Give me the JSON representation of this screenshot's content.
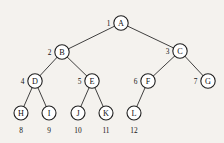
{
  "figure": {
    "type": "binary-tree-diagram",
    "background_color": "#f4f2ee",
    "stroke_color": "#1f1f1f",
    "text_color": "#111111",
    "node_radius": 7.2,
    "leaf_radius": 7.0
  },
  "nodes": [
    {
      "id": "A",
      "label": "A",
      "index": "1",
      "index_position": "left",
      "x": 121,
      "y": 23,
      "level": 0
    },
    {
      "id": "B",
      "label": "B",
      "index": "2",
      "index_position": "left",
      "x": 62,
      "y": 52,
      "level": 1
    },
    {
      "id": "C",
      "label": "C",
      "index": "3",
      "index_position": "left",
      "x": 180,
      "y": 51,
      "level": 1
    },
    {
      "id": "D",
      "label": "D",
      "index": "4",
      "index_position": "left",
      "x": 35,
      "y": 81,
      "level": 2
    },
    {
      "id": "E",
      "label": "E",
      "index": "5",
      "index_position": "left",
      "x": 92,
      "y": 81,
      "level": 2
    },
    {
      "id": "F",
      "label": "F",
      "index": "6",
      "index_position": "left",
      "x": 148,
      "y": 81,
      "level": 2
    },
    {
      "id": "G",
      "label": "G",
      "index": "7",
      "index_position": "left",
      "x": 208,
      "y": 81,
      "level": 2
    },
    {
      "id": "H",
      "label": "H",
      "index": "8",
      "index_position": "below",
      "x": 21,
      "y": 113,
      "level": 3
    },
    {
      "id": "I",
      "label": "I",
      "index": "9",
      "index_position": "below",
      "x": 49,
      "y": 113,
      "level": 3
    },
    {
      "id": "J",
      "label": "J",
      "index": "10",
      "index_position": "below",
      "x": 78,
      "y": 113,
      "level": 3
    },
    {
      "id": "K",
      "label": "K",
      "index": "11",
      "index_position": "below",
      "x": 106,
      "y": 113,
      "level": 3
    },
    {
      "id": "L",
      "label": "L",
      "index": "12",
      "index_position": "below",
      "x": 134,
      "y": 113,
      "level": 3
    }
  ],
  "edges": [
    {
      "from": "A",
      "to": "B",
      "side": "left"
    },
    {
      "from": "A",
      "to": "C",
      "side": "right"
    },
    {
      "from": "B",
      "to": "D",
      "side": "left"
    },
    {
      "from": "B",
      "to": "E",
      "side": "right"
    },
    {
      "from": "C",
      "to": "F",
      "side": "left"
    },
    {
      "from": "C",
      "to": "G",
      "side": "right"
    },
    {
      "from": "D",
      "to": "H",
      "side": "left"
    },
    {
      "from": "D",
      "to": "I",
      "side": "right"
    },
    {
      "from": "E",
      "to": "J",
      "side": "left"
    },
    {
      "from": "E",
      "to": "K",
      "side": "right"
    },
    {
      "from": "F",
      "to": "L",
      "side": "left"
    }
  ],
  "leaf_index_y": 130,
  "side_index_offset_x": 12.5
}
